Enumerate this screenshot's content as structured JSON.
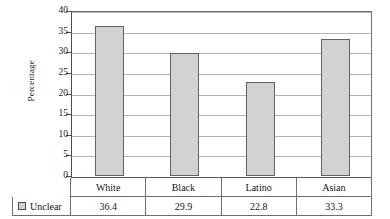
{
  "chart_data": {
    "type": "bar",
    "title": "",
    "xlabel": "",
    "ylabel": "Percentage",
    "categories": [
      "White",
      "Black",
      "Latino",
      "Asian"
    ],
    "series": [
      {
        "name": "Unclear",
        "values": [
          36.4,
          29.9,
          22.8,
          33.3
        ]
      }
    ],
    "value_labels": [
      "36.4",
      "29.9",
      "22.8",
      "33.3"
    ],
    "ylim": [
      0,
      40
    ],
    "ytick_labels": [
      "40",
      "35",
      "30",
      "25",
      "20",
      "15",
      "10",
      "5",
      "0"
    ],
    "ytick_values": [
      40,
      35,
      30,
      25,
      20,
      15,
      10,
      5,
      0
    ],
    "grid": true,
    "legend_position": "bottom-left",
    "colors": {
      "bar_fill": "#d2d2d2",
      "bar_border": "#636363",
      "gridline": "#b4b4b4",
      "axis": "#4d4d4d",
      "table_border": "#6e6e6e",
      "text": "#141414",
      "background": "#ffffff"
    }
  },
  "legend": {
    "swatch_name": "unclear-swatch",
    "label": "Unclear"
  },
  "axis": {
    "y_title": "Percentage"
  }
}
